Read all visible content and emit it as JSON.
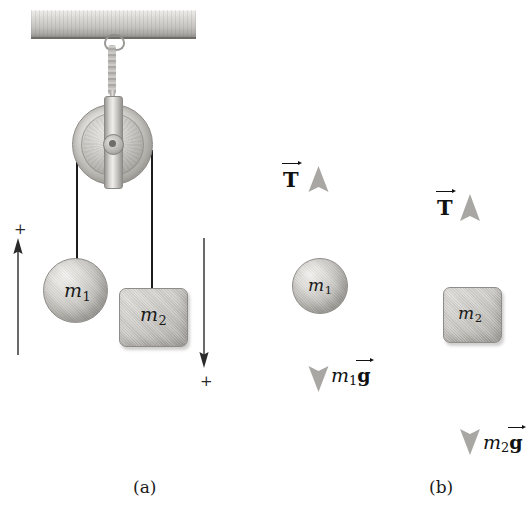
{
  "figure": {
    "captions": [
      {
        "key": "a",
        "label": "(a)"
      },
      {
        "key": "b",
        "label": "(b)"
      }
    ]
  },
  "panel_a": {
    "name": "pulley-system",
    "ceiling_beam": {
      "name": "ceiling-beam"
    },
    "hook": {
      "name": "ceiling-hook"
    },
    "chain": {
      "name": "support-chain"
    },
    "pulley": {
      "name": "pulley-wheel"
    },
    "strings": [
      {
        "name": "string-left"
      },
      {
        "name": "string-right"
      }
    ],
    "masses": [
      {
        "id": "m1",
        "shape": "sphere",
        "label_base": "m",
        "label_sub": "1"
      },
      {
        "id": "m2",
        "shape": "box",
        "label_base": "m",
        "label_sub": "2"
      }
    ],
    "direction_markers": [
      {
        "name": "positive-direction-left",
        "sign": "+",
        "direction": "up"
      },
      {
        "name": "positive-direction-right",
        "sign": "+",
        "direction": "down"
      }
    ]
  },
  "panel_b": {
    "name": "free-body-diagrams",
    "diagrams": [
      {
        "id": "fbd-m1",
        "body_shape": "sphere",
        "body_label_base": "m",
        "body_label_sub": "1",
        "forces": [
          {
            "name": "tension-force",
            "symbol": "T",
            "direction": "up",
            "vector": true
          },
          {
            "name": "weight-force",
            "symbol_base": "m",
            "symbol_sub": "1",
            "symbol_vec": "g",
            "direction": "down",
            "vector": true
          }
        ]
      },
      {
        "id": "fbd-m2",
        "body_shape": "box",
        "body_label_base": "m",
        "body_label_sub": "2",
        "forces": [
          {
            "name": "tension-force",
            "symbol": "T",
            "direction": "up",
            "vector": true
          },
          {
            "name": "weight-force",
            "symbol_base": "m",
            "symbol_sub": "2",
            "symbol_vec": "g",
            "direction": "down",
            "vector": true
          }
        ]
      }
    ]
  },
  "colors": {
    "background": "#ffffff",
    "metal_light": "#e3e1de",
    "metal_mid": "#bfbdb8",
    "metal_dark": "#8d8b86",
    "string": "#1c1c1c",
    "force_arrow": "#a8a7a3",
    "text": "#111111"
  }
}
